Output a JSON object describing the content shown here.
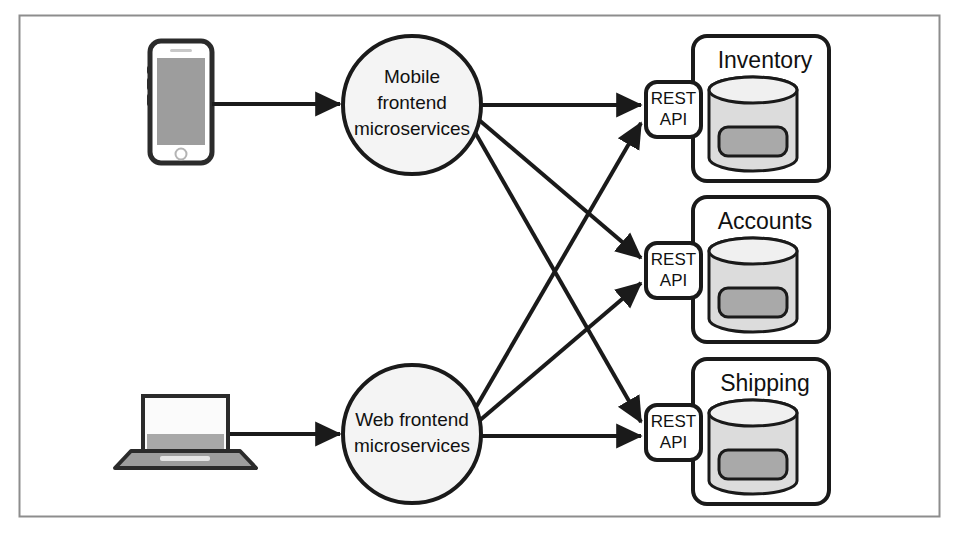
{
  "figure": {
    "border_color": "#8a8a8a",
    "background": "#ffffff",
    "line_color": "#1a1a1a"
  },
  "clients": [
    {
      "id": "phone",
      "icon": "smartphone-icon",
      "screen_color": "#9d9d9d",
      "body_color": "#2b2b2b"
    },
    {
      "id": "laptop",
      "icon": "laptop-icon",
      "screen_color": "#fbfbfb",
      "base_color": "#9d9d9d"
    }
  ],
  "frontends": [
    {
      "id": "mobile-frontend",
      "lines": [
        "Mobile",
        "frontend",
        "microservices"
      ],
      "fill": "#f4f4f4"
    },
    {
      "id": "web-frontend",
      "lines": [
        "Web frontend",
        "microservices"
      ],
      "fill": "#f4f4f4"
    }
  ],
  "api": {
    "line1": "REST",
    "line2": "API",
    "fill": "#ffffff"
  },
  "services": [
    {
      "id": "inventory",
      "title": "Inventory",
      "cylinder_fill": "#dcdcdc",
      "inner_fill": "#a9a9a9"
    },
    {
      "id": "accounts",
      "title": "Accounts",
      "cylinder_fill": "#dcdcdc",
      "inner_fill": "#a9a9a9"
    },
    {
      "id": "shipping",
      "title": "Shipping",
      "cylinder_fill": "#dcdcdc",
      "inner_fill": "#a9a9a9"
    }
  ],
  "connections": [
    {
      "from": "phone",
      "to": "mobile-frontend"
    },
    {
      "from": "laptop",
      "to": "web-frontend"
    },
    {
      "from": "mobile-frontend",
      "to": "inventory"
    },
    {
      "from": "mobile-frontend",
      "to": "accounts"
    },
    {
      "from": "mobile-frontend",
      "to": "shipping"
    },
    {
      "from": "web-frontend",
      "to": "inventory"
    },
    {
      "from": "web-frontend",
      "to": "accounts"
    },
    {
      "from": "web-frontend",
      "to": "shipping"
    }
  ]
}
